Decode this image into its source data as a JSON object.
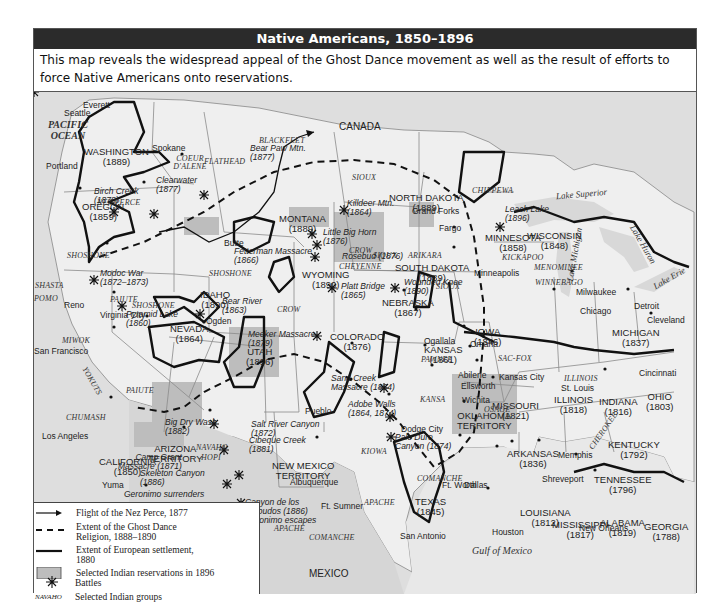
{
  "title": "Native Americans, 1850–1896",
  "caption": "This map reveals the widespread appeal of the Ghost Dance movement as well as the result of efforts to force Native Americans onto reservations.",
  "colors": {
    "title_bar": "#2b2b2b",
    "land": "#efefef",
    "water": "#dadada",
    "reservation": "#b9b9b9",
    "settlement_line": "#111111"
  },
  "map": {
    "oceans": [
      {
        "name": "PACIFIC",
        "name2": "OCEAN"
      },
      {
        "name": "Gulf of Mexico"
      }
    ],
    "countries": [
      "CANADA",
      "MEXICO"
    ],
    "lakes": [
      "Lake Superior",
      "Lake Michigan",
      "Lake Huron",
      "Lake Erie"
    ],
    "states": [
      {
        "name": "WASHINGTON",
        "year": "(1889)"
      },
      {
        "name": "OREGON",
        "year": "(1859)"
      },
      {
        "name": "CALIFORNIA",
        "year": "(1850)"
      },
      {
        "name": "NEVADA",
        "year": "(1864)"
      },
      {
        "name": "IDAHO",
        "year": "(1890)"
      },
      {
        "name": "MONTANA",
        "year": "(1889)"
      },
      {
        "name": "WYOMING",
        "year": "(1890)"
      },
      {
        "name": "UTAH",
        "year": "(1896)"
      },
      {
        "name": "COLORADO",
        "year": "(1876)"
      },
      {
        "name": "ARIZONA",
        "name2": "TERRITORY"
      },
      {
        "name": "NEW MEXICO",
        "name2": "TERRITORY"
      },
      {
        "name": "NORTH DAKOTA",
        "year": "(1889)"
      },
      {
        "name": "SOUTH DAKOTA",
        "year": "(1889)"
      },
      {
        "name": "NEBRASKA",
        "year": "(1867)"
      },
      {
        "name": "KANSAS",
        "year": "(1861)"
      },
      {
        "name": "OKLAHOMA",
        "name2": "TERRITORY"
      },
      {
        "name": "TEXAS",
        "year": "(1845)"
      },
      {
        "name": "MINNESOTA",
        "year": "(1858)"
      },
      {
        "name": "IOWA",
        "year": "(1846)"
      },
      {
        "name": "MISSOURI",
        "year": "(1821)"
      },
      {
        "name": "ARKANSAS",
        "year": "(1836)"
      },
      {
        "name": "LOUISIANA",
        "year": "(1812)"
      },
      {
        "name": "WISCONSIN",
        "year": "(1848)"
      },
      {
        "name": "ILLINOIS",
        "year": "(1818)"
      },
      {
        "name": "MICHIGAN",
        "year": "(1837)"
      },
      {
        "name": "INDIANA",
        "year": "(1816)"
      },
      {
        "name": "OHIO",
        "year": "(1803)"
      },
      {
        "name": "KENTUCKY",
        "year": "(1792)"
      },
      {
        "name": "TENNESSEE",
        "year": "(1796)"
      },
      {
        "name": "MISSISSIPPI",
        "year": "(1817)"
      },
      {
        "name": "ALABAMA",
        "year": "(1819)"
      },
      {
        "name": "GEORGIA",
        "year": "(1788)"
      }
    ],
    "cities": [
      "Everett",
      "Seattle",
      "Spokane",
      "Portland",
      "Reno",
      "Virginia City",
      "San Francisco",
      "Los Angeles",
      "Yuma",
      "Ogden",
      "Deming",
      "El Paso",
      "Albuquerque",
      "Ft. Sumner",
      "Pueblo",
      "Dodge City",
      "Grand Forks",
      "Fargo",
      "Minneapolis",
      "Milwaukee",
      "Chicago",
      "Detroit",
      "Cleveland",
      "Cincinnati",
      "Omaha",
      "Ogallala",
      "Abilene",
      "Ellsworth",
      "Wichita",
      "Kansas City",
      "St. Louis",
      "Memphis",
      "Shreveport",
      "Ft. Worth",
      "Dallas",
      "San Antonio",
      "Houston",
      "New Orleans",
      "Butte"
    ],
    "tribes": [
      "BLACKFEET",
      "FLATHEAD",
      "COEUR D'ALENE",
      "NEZ PERCE",
      "SHOSHONE",
      "SHOSHONE",
      "SHOSHONE",
      "SHASTA",
      "POMO",
      "MIWOK",
      "YOKUTS",
      "CHUMASH",
      "PAIUTE",
      "PAIUTE",
      "NAVAHO",
      "HOPI",
      "APACHE",
      "APACHE",
      "APACHE",
      "COMANCHE",
      "COMANCHE",
      "KIOWA",
      "CROW",
      "CROW",
      "SIOUX",
      "SIOUX",
      "SIOUX",
      "CHEYENNE",
      "ARIKARA",
      "PAWNEE",
      "KANSA",
      "OSAGE",
      "SAC-FOX",
      "ILLINOIS",
      "KICKAPOO",
      "WINNEBAGO",
      "MENOMINEE",
      "CHIPPEWA",
      "CHEROKEE"
    ],
    "battles": [
      {
        "name": "Bear Paw Mtn.",
        "year": "(1877)"
      },
      {
        "name": "Birch Creek",
        "year": "(1878)"
      },
      {
        "name": "Clearwater",
        "year": "(1877)"
      },
      {
        "name": "Modoc War",
        "year": "(1872–1873)"
      },
      {
        "name": "Pyramid Lake",
        "year": "(1860)"
      },
      {
        "name": "Bear River",
        "year": "(1863)"
      },
      {
        "name": "Killdeer Mtn.",
        "year": "(1864)"
      },
      {
        "name": "Little Big Horn",
        "year": "(1876)"
      },
      {
        "name": "Rosebud (1876)",
        "year": ""
      },
      {
        "name": "Fetterman Massacre",
        "year": "(1866)"
      },
      {
        "name": "Platt Bridge",
        "year": "(1865)"
      },
      {
        "name": "Wounded Knee",
        "year": "(1890)"
      },
      {
        "name": "Meeker Massacre",
        "year": "(1879)"
      },
      {
        "name": "Sand Creek",
        "year": "Massacre (1864)"
      },
      {
        "name": "Adobe Walls",
        "year": "(1864, 1874)"
      },
      {
        "name": "Palo Duro",
        "year": "Canyon (1874)"
      },
      {
        "name": "Big Dry Wash",
        "year": "(1882)"
      },
      {
        "name": "Salt River Canyon",
        "year": "(1872)"
      },
      {
        "name": "Cibeque Creek",
        "year": "(1881)"
      },
      {
        "name": "Camp Grant",
        "year": "Massacre (1871)"
      },
      {
        "name": "Skeleton Canyon",
        "year": "(1886)"
      },
      {
        "name": "Geronimo surrenders",
        "year": ""
      },
      {
        "name": "Canyon de los",
        "year": "Embudos (1886)"
      },
      {
        "name": "Geronimo escapes",
        "year": ""
      },
      {
        "name": "Leach Lake",
        "year": "(1896)"
      }
    ]
  },
  "legend": {
    "items": [
      {
        "symbol": "arrow",
        "label": "Flight of the Nez Perce, 1877"
      },
      {
        "symbol": "dashed",
        "label": "Extent of the Ghost Dance",
        "label2": "Religion, 1888–1890"
      },
      {
        "symbol": "solid",
        "label": "Extent of European settlement,",
        "label2": "1880"
      },
      {
        "symbol": "box",
        "label": "Selected Indian reservations in 1896"
      },
      {
        "symbol": "battle",
        "label": "Battles"
      },
      {
        "symbol": "group",
        "sample": "NAVAHO",
        "label": "Selected Indian groups"
      }
    ]
  }
}
